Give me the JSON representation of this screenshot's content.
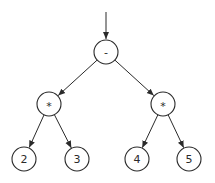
{
  "diagram": {
    "type": "expression-tree",
    "colors": {
      "stroke": "#2a2a2a",
      "background": "#ffffff"
    },
    "entry_arrow": {
      "from": [
        106,
        12
      ],
      "to": [
        106,
        39
      ]
    },
    "nodes": [
      {
        "id": "n0",
        "label": "-",
        "x": 106,
        "y": 52,
        "r": 12
      },
      {
        "id": "n1",
        "label": "*",
        "x": 49,
        "y": 104,
        "r": 12
      },
      {
        "id": "n2",
        "label": "*",
        "x": 163,
        "y": 104,
        "r": 12
      },
      {
        "id": "n3",
        "label": "2",
        "x": 24,
        "y": 159,
        "r": 12
      },
      {
        "id": "n4",
        "label": "3",
        "x": 77,
        "y": 159,
        "r": 12
      },
      {
        "id": "n5",
        "label": "4",
        "x": 137,
        "y": 159,
        "r": 12
      },
      {
        "id": "n6",
        "label": "5",
        "x": 189,
        "y": 159,
        "r": 12
      }
    ],
    "edges": [
      {
        "from": "n0",
        "to": "n1"
      },
      {
        "from": "n0",
        "to": "n2"
      },
      {
        "from": "n1",
        "to": "n3"
      },
      {
        "from": "n1",
        "to": "n4"
      },
      {
        "from": "n2",
        "to": "n5"
      },
      {
        "from": "n2",
        "to": "n6"
      }
    ]
  }
}
